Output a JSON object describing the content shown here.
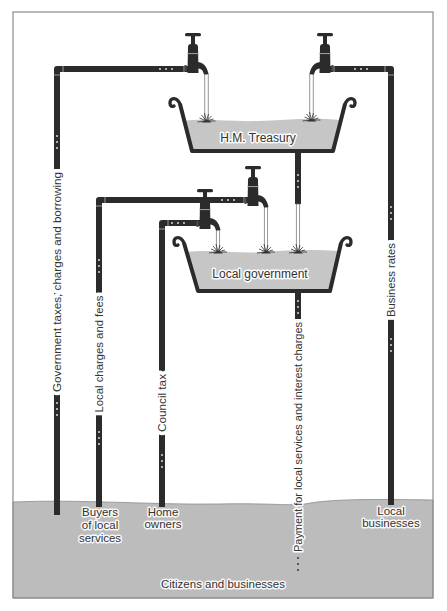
{
  "diagram": {
    "containers": {
      "treasury": {
        "label": "H.M. Treasury"
      },
      "local_government": {
        "label": "Local government"
      }
    },
    "flows": {
      "government_taxes": {
        "label": "Government taxes, charges and borrowing",
        "from": "Citizens and businesses",
        "to": "H.M. Treasury"
      },
      "business_rates": {
        "label": "Business rates",
        "from": "Local businesses",
        "to": "H.M. Treasury"
      },
      "local_charges": {
        "label": "Local charges and fees",
        "from": "Buyers of local services",
        "to": "Local government"
      },
      "council_tax": {
        "label": "Council tax",
        "from": "Home owners",
        "to": "Local government"
      },
      "treasury_to_local": {
        "from": "H.M. Treasury",
        "to": "Local government"
      },
      "payments": {
        "label": "Payment for local services and interest charges",
        "from": "Local government",
        "to": "Citizens and businesses"
      }
    },
    "sources": {
      "buyers": {
        "lines": [
          "Buyers",
          "of local",
          "services"
        ]
      },
      "home_owners": {
        "lines": [
          "Home",
          "owners"
        ]
      },
      "local_businesses": {
        "lines": [
          "Local",
          "businesses"
        ]
      }
    },
    "ground": {
      "label": "Citizens and businesses"
    },
    "colors": {
      "pipe": "#2b2b2b",
      "water": "#c6c6c6",
      "ground": "#bcbcbc",
      "frame": "#8c8c8c"
    }
  }
}
